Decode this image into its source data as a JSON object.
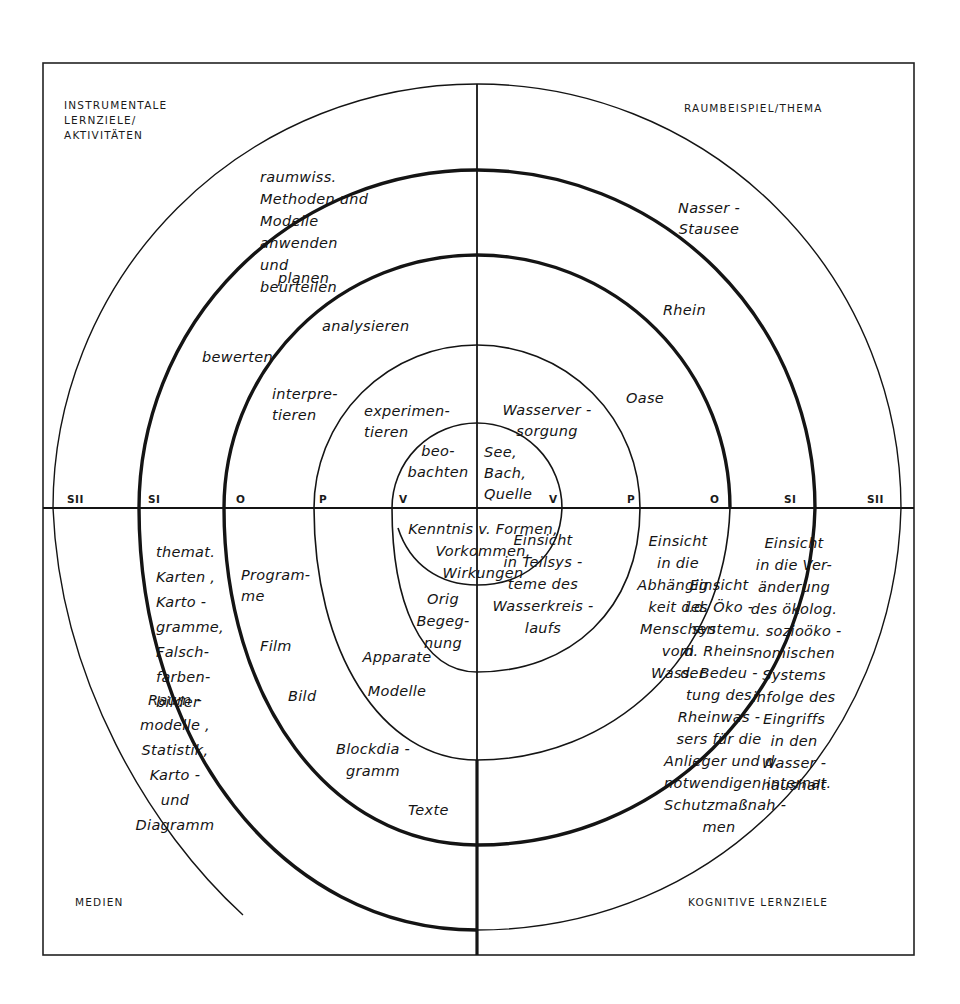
{
  "corners": {
    "top_left": "INSTRUMENTALE\nLERNZIELE/\nAKTIVITÄTEN",
    "top_right": "RAUMBEISPIEL/THEMA",
    "bottom_left": "MEDIEN",
    "bottom_right": "KOGNITIVE LERNZIELE"
  },
  "axis_levels": {
    "left": [
      "SII",
      "SI",
      "O",
      "P",
      "V"
    ],
    "right": [
      "V",
      "P",
      "O",
      "SI",
      "SII"
    ]
  },
  "activities": {
    "v": "beo-\nbachten",
    "p": "experimen-\ntieren",
    "o_interpret": "interpre-\ntieren",
    "o_analyse": "analysieren",
    "si_bewerten": "bewerten",
    "si_planen": "planen",
    "sii": "raumwiss.\nMethoden und\nModelle\nanwenden\nund\nbeurteilen"
  },
  "themes": {
    "v": "See,\nBach,\nQuelle",
    "p": "Wasserver -\nsorgung",
    "o": "Oase",
    "si": "Rhein",
    "sii": "Nasser -\nStausee"
  },
  "cognitive": {
    "v": "Kenntnis v. Formen,\nVorkommen,\nWirkungen",
    "p": "Einsicht\nin Teilsys -\nteme des\nWasserkreis -\nlaufs",
    "o": "Einsicht\nin die\nAbhängig -\nkeit des\nMenschen\nvom\nWasser",
    "si": "Einsicht\ni.d. Öko -\nsystem\nd. Rheins\nd. Bedeu -\ntung des\nRheinwas -\nsers für die\nAnlieger und d.\nnotwendigen internat.\nSchutzmaßnah -\nmen",
    "sii": "Einsicht\nin die Ver-\nänderung\ndes ökolog.\nu. sozioöko -\nnomischen\nSystems\ninfolge des\nEingriffs\nin den\nWasser -\nhaushalt"
  },
  "media": {
    "v": "Orig\nBegeg-\nnung",
    "p": "Apparate\nModelle",
    "o_a": "Program-\nme",
    "o_b": "Film",
    "o_c": "Bild",
    "o_d": "Blockdia -\ngramm",
    "o_e": "Texte",
    "si": "themat.\nKarten ,\nKarto -\ngramme,\nFalsch-\nfarben-\nbilder",
    "sii": "Raum -\nmodelle ,\nStatistik,\nKarto -\nund\nDiagramm"
  },
  "colors": {
    "ink": "#141414",
    "paper": "#ffffff"
  }
}
